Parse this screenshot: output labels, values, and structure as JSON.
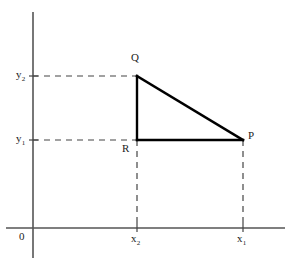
{
  "figure": {
    "background_color": "#ffffff",
    "axis_color": "#555555",
    "solid_line_color": "#000000",
    "dashed_line_color": "#444444",
    "label_color": "#222222",
    "width": 291,
    "height": 267
  },
  "axes": {
    "origin_label": "0",
    "x_axis": {
      "name": "x-axis",
      "y": 228,
      "x_start": 6,
      "x_end": 285
    },
    "y_axis": {
      "name": "y-axis",
      "x": 33,
      "y_start": 12,
      "y_end": 258
    }
  },
  "ticks": {
    "x": [
      {
        "label_text": "x",
        "subscript": "2",
        "value_x": 137
      },
      {
        "label_text": "x",
        "subscript": "1",
        "value_x": 243
      }
    ],
    "y": [
      {
        "label_text": "y",
        "subscript": "2",
        "value_y": 76
      },
      {
        "label_text": "y",
        "subscript": "1",
        "value_y": 140
      }
    ]
  },
  "points": [
    {
      "label": "Q",
      "x": 137,
      "y": 76,
      "label_x": 131,
      "label_y": 57
    },
    {
      "label": "P",
      "x": 243,
      "y": 140,
      "label_x": 248,
      "label_y": 135
    },
    {
      "label": "R",
      "x": 137,
      "y": 140,
      "label_x": 123,
      "label_y": 145
    }
  ],
  "triangle": {
    "name": "triangle-PQR",
    "vertices": "Q(x2,y2) R(x2,y1) P(x1,y1)",
    "sides": [
      {
        "name": "side-QR",
        "from": "Q",
        "to": "R"
      },
      {
        "name": "side-RP",
        "from": "R",
        "to": "P"
      },
      {
        "name": "side-QP-hypotenuse",
        "from": "Q",
        "to": "P"
      }
    ]
  },
  "guides": [
    {
      "name": "dashed-y2-to-Q",
      "x1": 33,
      "y1": 76,
      "x2": 137,
      "y2": 76
    },
    {
      "name": "dashed-y1-to-R",
      "x1": 33,
      "y1": 140,
      "x2": 137,
      "y2": 140
    },
    {
      "name": "dashed-R-to-x2",
      "x1": 137,
      "y1": 140,
      "x2": 137,
      "y2": 228
    },
    {
      "name": "dashed-P-to-x1",
      "x1": 243,
      "y1": 140,
      "x2": 243,
      "y2": 228
    }
  ],
  "labels": {
    "y2": {
      "base": "y",
      "sub": "2"
    },
    "y1": {
      "base": "y",
      "sub": "1"
    },
    "x2": {
      "base": "x",
      "sub": "2"
    },
    "x1": {
      "base": "x",
      "sub": "1"
    },
    "Q": "Q",
    "P": "P",
    "R": "R",
    "origin": "0"
  }
}
